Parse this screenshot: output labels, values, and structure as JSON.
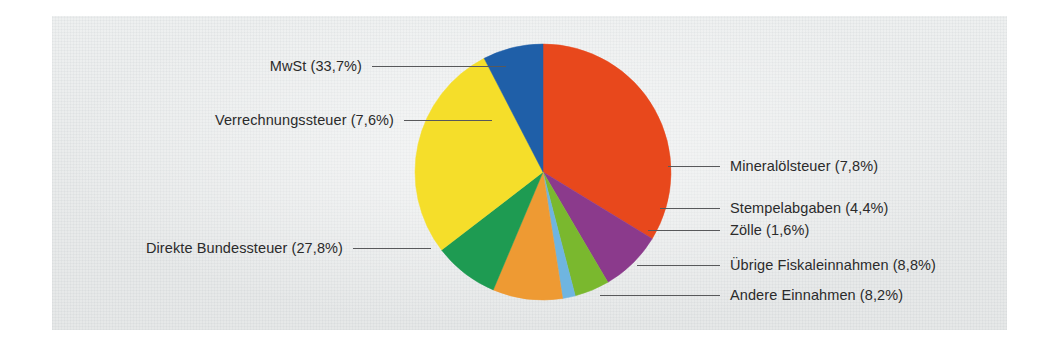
{
  "figure": {
    "background_color": "#ffffff",
    "paper_color": "#e9ebeb"
  },
  "chart_data": {
    "type": "pie",
    "title": "",
    "subtitle": "",
    "xlabel": "",
    "ylabel": "",
    "legend_position": "callout-labels",
    "grid": false,
    "start_angle_deg": 0,
    "direction": "clockwise",
    "units": "percent",
    "categories": [
      "MwSt",
      "Mineralölsteuer",
      "Stempelabgaben",
      "Zölle",
      "Übrige Fiskaleinnahmen",
      "Andere Einnahmen",
      "Direkte Bundessteuer",
      "Verrechnungssteuer"
    ],
    "values": [
      33.7,
      7.8,
      4.4,
      1.6,
      8.8,
      8.2,
      27.8,
      7.6
    ],
    "colors": [
      "#e8481c",
      "#8b3a8c",
      "#7ab82e",
      "#6fb5e0",
      "#ee9a33",
      "#1e9b52",
      "#f5de2a",
      "#1f5fa8"
    ],
    "slices": [
      {
        "label": "MwSt",
        "value": 33.7,
        "display": "MwSt (33,7%)",
        "color": "#e8481c",
        "side": "left"
      },
      {
        "label": "Mineralölsteuer",
        "value": 7.8,
        "display": "Mineralölsteuer (7,8%)",
        "color": "#8b3a8c",
        "side": "right"
      },
      {
        "label": "Stempelabgaben",
        "value": 4.4,
        "display": "Stempelabgaben (4,4%)",
        "color": "#7ab82e",
        "side": "right"
      },
      {
        "label": "Zölle",
        "value": 1.6,
        "display": "Zölle (1,6%)",
        "color": "#6fb5e0",
        "side": "right"
      },
      {
        "label": "Übrige Fiskaleinnahmen",
        "value": 8.8,
        "display": "Übrige Fiskaleinnahmen (8,8%)",
        "color": "#ee9a33",
        "side": "right"
      },
      {
        "label": "Andere Einnahmen",
        "value": 8.2,
        "display": "Andere Einnahmen (8,2%)",
        "color": "#1e9b52",
        "side": "right"
      },
      {
        "label": "Direkte Bundessteuer",
        "value": 27.8,
        "display": "Direkte Bundessteuer (27,8%)",
        "color": "#f5de2a",
        "side": "left"
      },
      {
        "label": "Verrechnungssteuer",
        "value": 7.6,
        "display": "Verrechnungssteuer (7,6%)",
        "color": "#1f5fa8",
        "side": "left"
      }
    ]
  },
  "labels": {
    "mwst": "MwSt (33,7%)",
    "verrechnungssteuer": "Verrechnungssteuer (7,6%)",
    "direkte_bundessteuer": "Direkte Bundessteuer (27,8%)",
    "mineraloelsteuer": "Mineralölsteuer (7,8%)",
    "stempelabgaben": "Stempelabgaben (4,4%)",
    "zoelle": "Zölle (1,6%)",
    "uebrige_fiskaleinnahmen": "Übrige Fiskaleinnahmen (8,8%)",
    "andere_einnahmen": "Andere Einnahmen (8,2%)"
  }
}
